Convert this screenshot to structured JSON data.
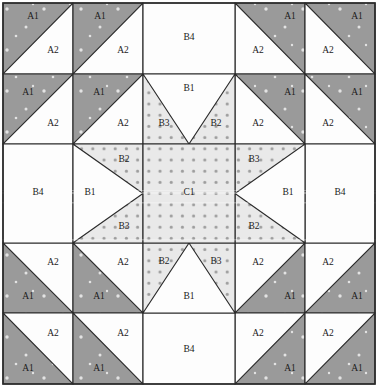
{
  "diagram": {
    "width": 379,
    "height": 387,
    "grid": {
      "columns_x": [
        3,
        73,
        143,
        235,
        305,
        375
      ],
      "rows_y": [
        3,
        74,
        144,
        243,
        313,
        384
      ]
    },
    "colors": {
      "fabric_a1_gray": "#9a9a9a",
      "fabric_a2_white": "#fdfdfd",
      "fabric_b1_white": "#fdfdfd",
      "fabric_b4_white": "#fdfdfd",
      "fabric_dotted_bg": "#e9e9e9",
      "fabric_dot": "#9d9d9d",
      "seam_line": "#2b2b2b",
      "background": "#ffffff"
    },
    "labels": {
      "a1": "A1",
      "a2": "A2",
      "b1": "B1",
      "b2": "B2",
      "b3": "B3",
      "b4": "B4",
      "c1": "C1"
    },
    "pieces": [
      {
        "id": "tl-r1c1-a1",
        "label": "A1",
        "fabric": "gray",
        "x": 33,
        "y": 17,
        "cell": "row1-col1"
      },
      {
        "id": "tl-r1c1-a2",
        "label": "A2",
        "fabric": "white",
        "x": 53,
        "y": 51,
        "cell": "row1-col1"
      },
      {
        "id": "tl-r1c2-a1",
        "label": "A1",
        "fabric": "gray",
        "x": 100,
        "y": 17,
        "cell": "row1-col2"
      },
      {
        "id": "tl-r1c2-a2",
        "label": "A2",
        "fabric": "white",
        "x": 123,
        "y": 51,
        "cell": "row1-col2"
      },
      {
        "id": "tl-r2c1-a1",
        "label": "A1",
        "fabric": "gray",
        "x": 28,
        "y": 93,
        "cell": "row2-col1"
      },
      {
        "id": "tl-r2c1-a2",
        "label": "A2",
        "fabric": "white",
        "x": 53,
        "y": 124,
        "cell": "row2-col1"
      },
      {
        "id": "tl-r2c2-a1",
        "label": "A1",
        "fabric": "gray",
        "x": 99,
        "y": 93,
        "cell": "row2-col2"
      },
      {
        "id": "tl-r2c2-a2",
        "label": "A2",
        "fabric": "white",
        "x": 123,
        "y": 124,
        "cell": "row2-col2"
      },
      {
        "id": "tr-r1c4-a1",
        "label": "A1",
        "fabric": "gray",
        "x": 290,
        "y": 17,
        "cell": "row1-col4"
      },
      {
        "id": "tr-r1c4-a2",
        "label": "A2",
        "fabric": "white",
        "x": 258,
        "y": 51,
        "cell": "row1-col4"
      },
      {
        "id": "tr-r1c5-a1",
        "label": "A1",
        "fabric": "gray",
        "x": 357,
        "y": 17,
        "cell": "row1-col5"
      },
      {
        "id": "tr-r1c5-a2",
        "label": "A2",
        "fabric": "white",
        "x": 328,
        "y": 51,
        "cell": "row1-col5"
      },
      {
        "id": "tr-r2c4-a1",
        "label": "A1",
        "fabric": "gray",
        "x": 290,
        "y": 93,
        "cell": "row2-col4"
      },
      {
        "id": "tr-r2c4-a2",
        "label": "A2",
        "fabric": "white",
        "x": 258,
        "y": 124,
        "cell": "row2-col4"
      },
      {
        "id": "tr-r2c5-a1",
        "label": "A1",
        "fabric": "gray",
        "x": 357,
        "y": 93,
        "cell": "row2-col5"
      },
      {
        "id": "tr-r2c5-a2",
        "label": "A2",
        "fabric": "white",
        "x": 328,
        "y": 124,
        "cell": "row2-col5"
      },
      {
        "id": "bl-r4c1-a1",
        "label": "A1",
        "fabric": "gray",
        "x": 28,
        "y": 297,
        "cell": "row4-col1"
      },
      {
        "id": "bl-r4c1-a2",
        "label": "A2",
        "fabric": "white",
        "x": 53,
        "y": 263,
        "cell": "row4-col1"
      },
      {
        "id": "bl-r4c2-a1",
        "label": "A1",
        "fabric": "gray",
        "x": 99,
        "y": 297,
        "cell": "row4-col2"
      },
      {
        "id": "bl-r4c2-a2",
        "label": "A2",
        "fabric": "white",
        "x": 123,
        "y": 263,
        "cell": "row4-col2"
      },
      {
        "id": "bl-r5c1-a1",
        "label": "A1",
        "fabric": "gray",
        "x": 28,
        "y": 369,
        "cell": "row5-col1"
      },
      {
        "id": "bl-r5c1-a2",
        "label": "A2",
        "fabric": "white",
        "x": 53,
        "y": 334,
        "cell": "row5-col1"
      },
      {
        "id": "bl-r5c2-a1",
        "label": "A1",
        "fabric": "gray",
        "x": 99,
        "y": 369,
        "cell": "row5-col2"
      },
      {
        "id": "bl-r5c2-a2",
        "label": "A2",
        "fabric": "white",
        "x": 123,
        "y": 334,
        "cell": "row5-col2"
      },
      {
        "id": "br-r4c4-a1",
        "label": "A1",
        "fabric": "gray",
        "x": 290,
        "y": 297,
        "cell": "row4-col4"
      },
      {
        "id": "br-r4c4-a2",
        "label": "A2",
        "fabric": "white",
        "x": 258,
        "y": 263,
        "cell": "row4-col4"
      },
      {
        "id": "br-r4c5-a1",
        "label": "A1",
        "fabric": "gray",
        "x": 357,
        "y": 297,
        "cell": "row4-col5"
      },
      {
        "id": "br-r4c5-a2",
        "label": "A2",
        "fabric": "white",
        "x": 328,
        "y": 263,
        "cell": "row4-col5"
      },
      {
        "id": "br-r5c4-a1",
        "label": "A1",
        "fabric": "gray",
        "x": 290,
        "y": 369,
        "cell": "row5-col4"
      },
      {
        "id": "br-r5c4-a2",
        "label": "A2",
        "fabric": "white",
        "x": 258,
        "y": 334,
        "cell": "row5-col4"
      },
      {
        "id": "br-r5c5-a1",
        "label": "A1",
        "fabric": "gray",
        "x": 357,
        "y": 369,
        "cell": "row5-col5"
      },
      {
        "id": "br-r5c5-a2",
        "label": "A2",
        "fabric": "white",
        "x": 328,
        "y": 334,
        "cell": "row5-col5"
      },
      {
        "id": "top-b4",
        "label": "B4",
        "fabric": "white",
        "x": 189,
        "y": 38,
        "cell": "row1-col3"
      },
      {
        "id": "bottom-b4",
        "label": "B4",
        "fabric": "white",
        "x": 189,
        "y": 350,
        "cell": "row5-col3"
      },
      {
        "id": "left-b4",
        "label": "B4",
        "fabric": "white",
        "x": 38,
        "y": 193,
        "cell": "row3-col1"
      },
      {
        "id": "right-b4",
        "label": "B4",
        "fabric": "white",
        "x": 340,
        "y": 193,
        "cell": "row3-col5"
      },
      {
        "id": "top-b1",
        "label": "B1",
        "fabric": "white",
        "x": 189,
        "y": 89,
        "cell": "row2-col3"
      },
      {
        "id": "top-b3",
        "label": "B3",
        "fabric": "dotted",
        "x": 164,
        "y": 124,
        "cell": "row2-col3"
      },
      {
        "id": "top-b2",
        "label": "B2",
        "fabric": "dotted",
        "x": 216,
        "y": 124,
        "cell": "row2-col3"
      },
      {
        "id": "bottom-b2",
        "label": "B2",
        "fabric": "dotted",
        "x": 164,
        "y": 262,
        "cell": "row4-col3"
      },
      {
        "id": "bottom-b3",
        "label": "B3",
        "fabric": "dotted",
        "x": 216,
        "y": 262,
        "cell": "row4-col3"
      },
      {
        "id": "bottom-b1",
        "label": "B1",
        "fabric": "white",
        "x": 189,
        "y": 297,
        "cell": "row4-col3"
      },
      {
        "id": "left-b1",
        "label": "B1",
        "fabric": "white",
        "x": 90,
        "y": 193,
        "cell": "row3-col2"
      },
      {
        "id": "left-b2",
        "label": "B2",
        "fabric": "dotted",
        "x": 124,
        "y": 160,
        "cell": "row3-col2"
      },
      {
        "id": "left-b3",
        "label": "B3",
        "fabric": "dotted",
        "x": 124,
        "y": 227,
        "cell": "row3-col2"
      },
      {
        "id": "right-b1",
        "label": "B1",
        "fabric": "white",
        "x": 288,
        "y": 193,
        "cell": "row3-col4"
      },
      {
        "id": "right-b3",
        "label": "B3",
        "fabric": "dotted",
        "x": 254,
        "y": 160,
        "cell": "row3-col4"
      },
      {
        "id": "right-b2",
        "label": "B2",
        "fabric": "dotted",
        "x": 254,
        "y": 227,
        "cell": "row3-col4"
      },
      {
        "id": "center-c1",
        "label": "C1",
        "fabric": "dotted",
        "x": 189,
        "y": 193,
        "cell": "row3-col3"
      }
    ]
  }
}
